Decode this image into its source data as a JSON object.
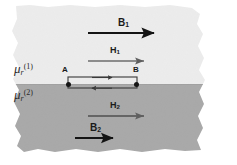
{
  "figure": {
    "background_color": "#ffffff",
    "media": [
      {
        "id": "medium-1",
        "label_mu": "μ",
        "label_sub": "r",
        "label_sup": "(1)",
        "fill_color": "#ececec",
        "region": "upper"
      },
      {
        "id": "medium-2",
        "label_mu": "μ",
        "label_sub": "r",
        "label_sup": "(2)",
        "fill_color": "#a8a8a8",
        "region": "lower"
      }
    ],
    "field_vectors": [
      {
        "name": "B1",
        "label_main": "B",
        "label_sub": "1",
        "color": "#141414",
        "thickness": 2.2,
        "x1": 88,
        "x2": 158,
        "y": 33,
        "label_x": 118,
        "label_y": 20,
        "font_size": 10,
        "direction": "right",
        "region": "medium-1"
      },
      {
        "name": "H1",
        "label_main": "H",
        "label_sub": "1",
        "color": "#6b6b6b",
        "thickness": 1.3,
        "x1": 88,
        "x2": 148,
        "y": 61,
        "label_x": 110,
        "label_y": 48,
        "font_size": 9,
        "direction": "right",
        "region": "medium-1"
      },
      {
        "name": "H2",
        "label_main": "H",
        "label_sub": "2",
        "color": "#555555",
        "thickness": 1.3,
        "x1": 88,
        "x2": 148,
        "y": 116,
        "label_x": 110,
        "label_y": 103,
        "font_size": 9,
        "direction": "right",
        "region": "medium-2"
      },
      {
        "name": "B2",
        "label_main": "B",
        "label_sub": "2",
        "color": "#141414",
        "thickness": 2.0,
        "x1": 75,
        "x2": 117,
        "y": 138,
        "label_x": 90,
        "label_y": 125,
        "font_size": 10,
        "direction": "right",
        "region": "medium-2"
      }
    ],
    "amperian_loop": {
      "name": "amperian-loop-AB",
      "left_x": 68,
      "right_x": 137,
      "top_y": 77,
      "bottom_y": 88,
      "stroke_color": "#3a3a3a",
      "endpoints": [
        {
          "label": "A",
          "x": 68,
          "y": 84,
          "label_x": 63,
          "label_y": 67
        },
        {
          "label": "B",
          "x": 137,
          "y": 84,
          "label_x": 134,
          "label_y": 67
        }
      ],
      "segment_arrows": [
        {
          "name": "loop-top-arrow",
          "direction": "right",
          "y": 78
        },
        {
          "name": "loop-bottom-arrow",
          "direction": "left",
          "y": 88
        }
      ]
    },
    "interface": {
      "name": "media-interface",
      "y": 84,
      "description": "boundary between medium 1 and medium 2"
    },
    "mu_labels": [
      {
        "name": "mu-r-1",
        "x": 14,
        "y": 62,
        "font_size": 13,
        "sup": "(1)",
        "sub": "r",
        "base": "μ"
      },
      {
        "name": "mu-r-2",
        "x": 14,
        "y": 88,
        "font_size": 13,
        "sup": "(2)",
        "sub": "r",
        "base": "μ"
      }
    ]
  }
}
